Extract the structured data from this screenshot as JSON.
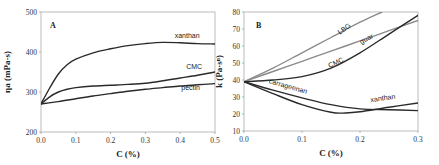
{
  "chart_data": [
    {
      "type": "line",
      "panel": "A",
      "xlabel": "C (%)",
      "ylabel": "ηa (mPa·s)",
      "xlim": [
        0,
        0.5
      ],
      "ylim": [
        200,
        500
      ],
      "xticks": [
        "0.0",
        "0.1",
        "0.2",
        "0.3",
        "0.4",
        "0.5"
      ],
      "yticks": [
        "200",
        "300",
        "400",
        "500"
      ],
      "xtick_values": [
        0,
        0.1,
        0.2,
        0.3,
        0.4,
        0.5
      ],
      "ytick_values": [
        200,
        300,
        400,
        500
      ],
      "grid": false,
      "series": [
        {
          "name": "xanthan",
          "color": "#2a2a2a",
          "x": [
            0,
            0.025,
            0.05,
            0.075,
            0.1,
            0.15,
            0.2,
            0.25,
            0.3,
            0.35,
            0.4,
            0.45,
            0.5
          ],
          "y": [
            270,
            310,
            345,
            368,
            382,
            398,
            408,
            416,
            421,
            424,
            423,
            421,
            420
          ]
        },
        {
          "name": "CMC",
          "color": "#2a2a2a",
          "x": [
            0,
            0.025,
            0.05,
            0.075,
            0.1,
            0.15,
            0.2,
            0.25,
            0.3,
            0.35,
            0.4,
            0.45,
            0.5
          ],
          "y": [
            270,
            288,
            300,
            307,
            311,
            315,
            317,
            319,
            322,
            328,
            335,
            342,
            350
          ]
        },
        {
          "name": "pectin",
          "color": "#2a2a2a",
          "x": [
            0,
            0.05,
            0.1,
            0.15,
            0.2,
            0.25,
            0.3,
            0.35,
            0.4,
            0.45,
            0.5
          ],
          "y": [
            270,
            276,
            283,
            290,
            296,
            302,
            307,
            311,
            315,
            318,
            321
          ]
        }
      ],
      "labels": [
        {
          "text": "xanthan",
          "x": 0.42,
          "y": 435
        },
        {
          "text": "CMC",
          "x": 0.44,
          "y": 358
        },
        {
          "text": "pectin",
          "x": 0.43,
          "y": 305
        }
      ]
    },
    {
      "type": "line",
      "panel": "B",
      "xlabel": "C (%)",
      "ylabel": "k (Pa·sⁿ)",
      "xlim": [
        0,
        0.3
      ],
      "ylim": [
        10,
        80
      ],
      "xticks": [
        "0.0",
        "0.1",
        "0.2",
        "0.3"
      ],
      "yticks": [
        "10",
        "20",
        "30",
        "40",
        "50",
        "60",
        "70",
        "80"
      ],
      "xtick_values": [
        0,
        0.1,
        0.2,
        0.3
      ],
      "ytick_values": [
        10,
        20,
        30,
        40,
        50,
        60,
        70,
        80
      ],
      "grid": false,
      "series": [
        {
          "name": "LBG",
          "color": "#8a8a8a",
          "x": [
            0,
            0.05,
            0.1,
            0.15,
            0.2,
            0.238
          ],
          "y": [
            39,
            47,
            56,
            65,
            74,
            80
          ]
        },
        {
          "name": "guar",
          "color": "#8a8a8a",
          "x": [
            0,
            0.05,
            0.1,
            0.15,
            0.2,
            0.25,
            0.3
          ],
          "y": [
            39,
            45,
            51,
            57,
            63,
            69,
            75
          ]
        },
        {
          "name": "CMC",
          "color": "#2a2a2a",
          "x": [
            0,
            0.05,
            0.1,
            0.15,
            0.2,
            0.25,
            0.3
          ],
          "y": [
            39,
            40,
            42,
            47,
            56,
            67,
            78
          ]
        },
        {
          "name": "carrageenan",
          "color": "#2a2a2a",
          "x": [
            0,
            0.05,
            0.1,
            0.15,
            0.2,
            0.25,
            0.3
          ],
          "y": [
            39,
            34,
            29.5,
            25.5,
            23,
            22.5,
            22
          ]
        },
        {
          "name": "xanthan",
          "color": "#2a2a2a",
          "x": [
            0,
            0.05,
            0.1,
            0.15,
            0.175,
            0.2,
            0.25,
            0.3
          ],
          "y": [
            39,
            32,
            25.5,
            21,
            20.6,
            21.3,
            24,
            26.5
          ]
        }
      ],
      "labels": [
        {
          "text": "LBG",
          "x": 0.175,
          "y": 69,
          "angle": -35
        },
        {
          "text": "guar",
          "x": 0.213,
          "y": 63,
          "angle": -28
        },
        {
          "text": "CMC",
          "x": 0.16,
          "y": 49,
          "angle": -25
        },
        {
          "text": "carrageenan",
          "x": 0.075,
          "y": 35,
          "angle": 16
        },
        {
          "text": "xanthan",
          "x": 0.24,
          "y": 28,
          "angle": -8
        }
      ]
    }
  ]
}
